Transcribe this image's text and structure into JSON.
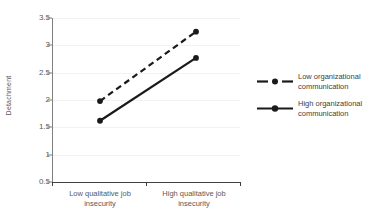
{
  "chart_data": {
    "type": "line",
    "title": "",
    "xlabel": "",
    "ylabel": "Detachment",
    "categories": [
      "Low qualitative job insecurity",
      "High qualitative job insecurity"
    ],
    "ylim": [
      0.5,
      3.5
    ],
    "ytick_labels": [
      "3.5",
      "3",
      "2.5",
      "2",
      "1.5",
      "1",
      "0.5"
    ],
    "ytick_values": [
      3.5,
      3,
      2.5,
      2,
      1.5,
      1,
      0.5
    ],
    "grid": true,
    "legend_position": "right",
    "series": [
      {
        "name": "Low organizational communication",
        "name_line1": "Low organizational",
        "name_line2": "communication",
        "style": "dashed",
        "marker": "circle",
        "color": "#1a1a1a",
        "values": [
          1.98,
          3.25
        ]
      },
      {
        "name": "High organizational communication",
        "name_line1": "High organizational",
        "name_line2": "communication",
        "style": "solid",
        "marker": "circle",
        "color": "#1a1a1a",
        "values": [
          1.62,
          2.77
        ]
      }
    ]
  },
  "axes": {
    "y_title": "Detachment",
    "x_categories": [
      {
        "line1": "Low qualitative job",
        "line2": "insecurity"
      },
      {
        "line1": "High qualitative job",
        "line2": "insecurity"
      }
    ]
  },
  "colors": {
    "line": "#1a1a1a",
    "grid": "#f2f2f2",
    "axis": "#404040",
    "tick_text": "#595959"
  }
}
